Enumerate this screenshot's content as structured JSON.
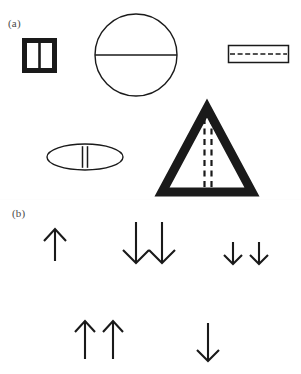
{
  "figure": {
    "width": 301,
    "height": 374,
    "background_color": "#ffffff",
    "ink_color": "#1a1a1a",
    "label_color": "#4a4a4a"
  },
  "panels": [
    {
      "id": "a",
      "label": "(a)",
      "description": "Five outlined geometric cross-section shapes, each bisected by an internal line",
      "shapes": [
        {
          "name": "square-divided",
          "type": "square",
          "stroke": "thick",
          "stroke_width": 5,
          "x": 22,
          "y": 38,
          "width": 30,
          "height": 30,
          "internal_marking": "single-vertical-line",
          "internal_style": "solid"
        },
        {
          "name": "circle-divided",
          "type": "circle",
          "stroke": "thin",
          "stroke_width": 1.4,
          "cx": 136,
          "cy": 55,
          "r": 41,
          "internal_marking": "horizontal-diameter",
          "internal_style": "solid"
        },
        {
          "name": "rectangle-dashed",
          "type": "rectangle",
          "stroke": "thin",
          "stroke_width": 1.4,
          "x": 228,
          "y": 45,
          "width": 60,
          "height": 17,
          "internal_marking": "horizontal-center-line",
          "internal_style": "dashed",
          "dash_count": 8
        },
        {
          "name": "ellipse-double-line",
          "type": "ellipse",
          "stroke": "thin",
          "stroke_width": 1.4,
          "cx": 85,
          "cy": 157,
          "rx": 38,
          "ry": 13,
          "internal_marking": "double-vertical-line",
          "internal_style": "solid"
        },
        {
          "name": "triangle-dashed",
          "type": "triangle",
          "stroke": "thick",
          "stroke_width": 9,
          "apex_x": 207,
          "apex_y": 106,
          "base_left_x": 163,
          "base_right_x": 252,
          "base_y": 190,
          "internal_marking": "double-vertical-line",
          "internal_style": "dashed",
          "dash_count": 7
        }
      ]
    },
    {
      "id": "b",
      "label": "(b)",
      "description": "Five groups of straight arrows pointing up or down",
      "arrow_groups": [
        {
          "name": "arrow-group-1",
          "direction": "up",
          "count": 1,
          "length": "short",
          "arrows": [
            {
              "x": 55,
              "y_tail": 261,
              "y_head": 229,
              "head_width": 11
            }
          ]
        },
        {
          "name": "arrow-group-2",
          "direction": "down",
          "count": 2,
          "length": "long",
          "arrows": [
            {
              "x": 136,
              "y_tail": 222,
              "y_head": 263,
              "head_width": 13
            },
            {
              "x": 162,
              "y_tail": 222,
              "y_head": 263,
              "head_width": 13
            }
          ]
        },
        {
          "name": "arrow-group-3",
          "direction": "down",
          "count": 2,
          "length": "short",
          "arrows": [
            {
              "x": 233,
              "y_tail": 242,
              "y_head": 264,
              "head_width": 9
            },
            {
              "x": 259,
              "y_tail": 242,
              "y_head": 264,
              "head_width": 9
            }
          ]
        },
        {
          "name": "arrow-group-4",
          "direction": "up",
          "count": 2,
          "length": "long",
          "arrows": [
            {
              "x": 85,
              "y_tail": 359,
              "y_head": 321,
              "head_width": 11
            },
            {
              "x": 113,
              "y_tail": 359,
              "y_head": 321,
              "head_width": 11
            }
          ]
        },
        {
          "name": "arrow-group-5",
          "direction": "down",
          "count": 1,
          "length": "long",
          "arrows": [
            {
              "x": 208,
              "y_tail": 323,
              "y_head": 361,
              "head_width": 11
            }
          ]
        }
      ]
    }
  ]
}
